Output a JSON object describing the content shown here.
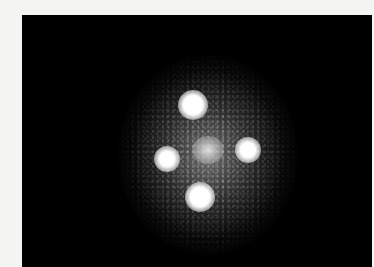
{
  "image": {
    "subject": "quadruply imaged point source (cross pattern) on black background",
    "background_color": "#000000",
    "border_color": "#f4f4f2",
    "spots": [
      {
        "name": "top",
        "x": 193,
        "y": 105,
        "r": 13
      },
      {
        "name": "left",
        "x": 167,
        "y": 159,
        "r": 11
      },
      {
        "name": "right",
        "x": 248,
        "y": 150,
        "r": 11
      },
      {
        "name": "bottom",
        "x": 200,
        "y": 197,
        "r": 13
      },
      {
        "name": "center",
        "x": 208,
        "y": 150,
        "r": 14
      }
    ]
  }
}
